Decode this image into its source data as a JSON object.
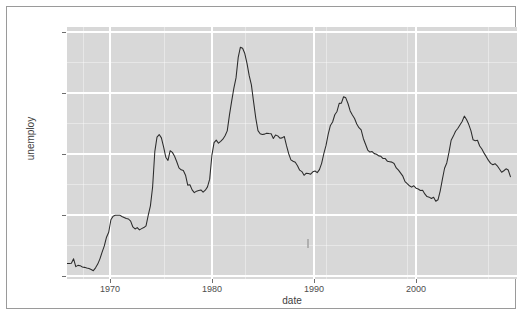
{
  "figure": {
    "background_color": "#ffffff",
    "frame_color": "#9a9a9a",
    "panel_color": "#d8d8d8",
    "gridline_color": "#ffffff",
    "line_color": "#2b2b2b"
  },
  "chart_data": {
    "type": "line",
    "title": "",
    "subtitle": "",
    "xlabel": "date",
    "ylabel": "unemploy",
    "xlim": [
      1967.0,
      2008.0
    ],
    "ylim": [
      2300,
      12800
    ],
    "grid": true,
    "legend": null,
    "legend_position": "none",
    "x_ticks": [
      1970,
      1980,
      1990,
      2000
    ],
    "x_tick_labels": [
      "1970",
      "1980",
      "1990",
      "2000"
    ],
    "y_ticks": [
      2500,
      5000,
      7500,
      10000,
      12500
    ],
    "y_tick_labels": [
      "2500",
      "5000",
      "7500",
      "10000",
      "12500"
    ],
    "series": [
      {
        "name": "unemploy",
        "x": [
          1967.0,
          1967.2,
          1967.4,
          1967.6,
          1967.8,
          1968.0,
          1968.2,
          1968.4,
          1968.6,
          1968.8,
          1969.0,
          1969.2,
          1969.4,
          1969.6,
          1969.8,
          1970.0,
          1970.2,
          1970.4,
          1970.6,
          1970.8,
          1971.0,
          1971.2,
          1971.4,
          1971.6,
          1971.8,
          1972.0,
          1972.2,
          1972.4,
          1972.6,
          1972.8,
          1973.0,
          1973.2,
          1973.4,
          1973.6,
          1973.8,
          1974.0,
          1974.2,
          1974.4,
          1974.6,
          1974.8,
          1975.0,
          1975.2,
          1975.4,
          1975.6,
          1975.8,
          1976.0,
          1976.2,
          1976.4,
          1976.6,
          1976.8,
          1977.0,
          1977.2,
          1977.4,
          1977.6,
          1977.8,
          1978.0,
          1978.2,
          1978.4,
          1978.6,
          1978.8,
          1979.0,
          1979.2,
          1979.4,
          1979.6,
          1979.8,
          1980.0,
          1980.2,
          1980.4,
          1980.6,
          1980.8,
          1981.0,
          1981.2,
          1981.4,
          1981.6,
          1981.8,
          1982.0,
          1982.2,
          1982.4,
          1982.6,
          1982.8,
          1983.0,
          1983.2,
          1983.4,
          1983.6,
          1983.8,
          1984.0,
          1984.2,
          1984.4,
          1984.6,
          1984.8,
          1985.0,
          1985.2,
          1985.4,
          1985.6,
          1985.8,
          1986.0,
          1986.2,
          1986.4,
          1986.6,
          1986.8,
          1987.0,
          1987.2,
          1987.4,
          1987.6,
          1987.8,
          1988.0,
          1988.2,
          1988.4,
          1988.6,
          1988.8,
          1989.0,
          1989.2,
          1989.4,
          1989.6,
          1989.8,
          1990.0,
          1990.2,
          1990.4,
          1990.6,
          1990.8,
          1991.0,
          1991.2,
          1991.4,
          1991.6,
          1991.8,
          1992.0,
          1992.2,
          1992.4,
          1992.6,
          1992.8,
          1993.0,
          1993.2,
          1993.4,
          1993.6,
          1993.8,
          1994.0,
          1994.2,
          1994.4,
          1994.6,
          1994.8,
          1995.0,
          1995.2,
          1995.4,
          1995.6,
          1995.8,
          1996.0,
          1996.2,
          1996.4,
          1996.6,
          1996.8,
          1997.0,
          1997.2,
          1997.4,
          1997.6,
          1997.8,
          1998.0,
          1998.2,
          1998.4,
          1998.6,
          1998.8,
          1999.0,
          1999.2,
          1999.4,
          1999.6,
          1999.8,
          2000.0,
          2000.2,
          2000.4,
          2000.6,
          2000.8,
          2001.0,
          2001.2,
          2001.4,
          2001.6,
          2001.8,
          2002.0,
          2002.2,
          2002.4,
          2002.6,
          2002.8,
          2003.0,
          2003.2,
          2003.4,
          2003.6,
          2003.8,
          2004.0,
          2004.2,
          2004.4,
          2004.6,
          2004.8,
          2005.0,
          2005.2,
          2005.4,
          2005.6,
          2005.8,
          2006.0,
          2006.2,
          2006.4,
          2006.6,
          2006.8,
          2007.0,
          2007.2,
          2007.4
        ],
        "y": [
          2944,
          2945,
          2958,
          3143,
          2816,
          2868,
          2856,
          2800,
          2785,
          2756,
          2739,
          2698,
          2647,
          2766,
          2921,
          3140,
          3420,
          3680,
          4040,
          4247,
          4768,
          4914,
          4954,
          4959,
          4960,
          4907,
          4864,
          4821,
          4800,
          4710,
          4468,
          4384,
          4442,
          4348,
          4398,
          4443,
          4517,
          4950,
          5348,
          6132,
          7605,
          8210,
          8318,
          8179,
          7806,
          7375,
          7240,
          7645,
          7576,
          7412,
          7187,
          6933,
          6848,
          6818,
          6625,
          6211,
          6227,
          6012,
          5899,
          5960,
          5986,
          6010,
          5916,
          6000,
          6138,
          6461,
          7448,
          7985,
          8088,
          7957,
          8038,
          8125,
          8272,
          8473,
          9127,
          9700,
          10244,
          10678,
          11534,
          11958,
          11912,
          11695,
          11287,
          10773,
          10390,
          9680,
          9004,
          8484,
          8354,
          8321,
          8337,
          8377,
          8361,
          8354,
          8154,
          8302,
          8264,
          8167,
          8180,
          8235,
          7853,
          7519,
          7266,
          7208,
          7162,
          7018,
          6836,
          6776,
          6621,
          6707,
          6700,
          6669,
          6766,
          6799,
          6730,
          6858,
          7119,
          7523,
          7867,
          8340,
          8698,
          8842,
          9143,
          9281,
          9617,
          9625,
          9894,
          9849,
          9612,
          9304,
          9133,
          8989,
          8761,
          8604,
          8509,
          8156,
          7914,
          7674,
          7589,
          7611,
          7524,
          7499,
          7430,
          7411,
          7318,
          7318,
          7202,
          7186,
          7170,
          7110,
          6928,
          6834,
          6710,
          6584,
          6358,
          6269,
          6184,
          6129,
          6186,
          6085,
          6052,
          5988,
          5998,
          5844,
          5733,
          5711,
          5655,
          5705,
          5542,
          5600,
          5964,
          6453,
          6914,
          7136,
          7573,
          8081,
          8254,
          8457,
          8573,
          8716,
          8861,
          9085,
          8947,
          8744,
          8479,
          8098,
          8062,
          8080,
          7840,
          7718,
          7544,
          7398,
          7243,
          7120,
          7062,
          7103,
          7016,
          6886,
          6750,
          6810,
          6892,
          6841,
          6565
        ]
      }
    ]
  },
  "axes": {
    "y_label": "unemploy",
    "x_label": "date"
  }
}
